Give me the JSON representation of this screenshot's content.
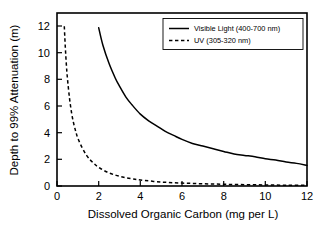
{
  "chart_data": {
    "type": "line",
    "title": "",
    "xlabel": "Dissolved Organic Carbon (mg per L)",
    "ylabel": "Depth to 99% Attenuation (m)",
    "xlim": [
      0,
      12
    ],
    "ylim": [
      0,
      13
    ],
    "xticks": [
      0,
      2,
      4,
      6,
      8,
      10,
      12
    ],
    "yticks": [
      0,
      2,
      4,
      6,
      8,
      10,
      12
    ],
    "xtick_labels": [
      "0",
      "2",
      "4",
      "6",
      "8",
      "10",
      "12"
    ],
    "ytick_labels": [
      "0",
      "2",
      "4",
      "6",
      "8",
      "10",
      "12"
    ],
    "grid": false,
    "legend_position": "top-right",
    "series": [
      {
        "name": "Visible Light (400-700 nm)",
        "style": "solid",
        "color": "#000000",
        "x": [
          2.0,
          2.2,
          2.5,
          2.8,
          3.0,
          3.3,
          3.6,
          4.0,
          4.4,
          4.8,
          5.2,
          5.6,
          6.0,
          6.5,
          7.0,
          7.5,
          8.0,
          8.5,
          9.0,
          9.5,
          10.0,
          10.5,
          11.0,
          11.5,
          12.0
        ],
        "y": [
          11.9,
          10.6,
          9.2,
          8.1,
          7.5,
          6.7,
          6.1,
          5.4,
          4.9,
          4.5,
          4.1,
          3.8,
          3.5,
          3.2,
          3.0,
          2.8,
          2.6,
          2.4,
          2.3,
          2.2,
          2.05,
          1.95,
          1.8,
          1.7,
          1.55
        ]
      },
      {
        "name": "UV (305-320 nm)",
        "style": "dashed",
        "color": "#000000",
        "x": [
          0.35,
          0.4,
          0.45,
          0.5,
          0.6,
          0.7,
          0.8,
          0.9,
          1.0,
          1.2,
          1.4,
          1.6,
          1.8,
          2.0,
          2.4,
          2.8,
          3.2,
          3.6,
          4.0,
          5.0,
          6.0,
          7.0,
          8.0,
          9.0,
          10.0,
          11.0,
          12.0
        ],
        "y": [
          12.0,
          10.4,
          9.1,
          8.1,
          6.6,
          5.5,
          4.7,
          4.1,
          3.6,
          2.9,
          2.35,
          1.95,
          1.65,
          1.4,
          1.05,
          0.82,
          0.66,
          0.54,
          0.45,
          0.3,
          0.22,
          0.17,
          0.13,
          0.1,
          0.08,
          0.06,
          0.05
        ]
      }
    ]
  },
  "legend": {
    "entries": [
      {
        "label": "Visible Light (400-700 nm)",
        "style": "solid"
      },
      {
        "label": "UV (305-320 nm)",
        "style": "dashed"
      }
    ]
  },
  "axes": {
    "x_title": "Dissolved Organic Carbon (mg per L)",
    "y_title": "Depth to 99% Attenuation (m)",
    "x_tick_labels": [
      "0",
      "2",
      "4",
      "6",
      "8",
      "10",
      "12"
    ],
    "y_tick_labels": [
      "0",
      "2",
      "4",
      "6",
      "8",
      "10",
      "12"
    ]
  }
}
